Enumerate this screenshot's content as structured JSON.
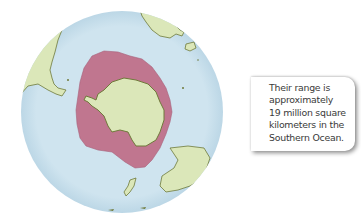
{
  "map": {
    "title": "Southern Ocean polar projection",
    "colors": {
      "ocean": "#cfe4ef",
      "land": "#dbe7b9",
      "land_outline": "#6f7a3b",
      "range": "#c0768f",
      "background": "#ffffff"
    },
    "features": [
      {
        "name": "Antarctica",
        "type": "land"
      },
      {
        "name": "range-area",
        "type": "range",
        "label": "Range around Antarctica"
      },
      {
        "name": "South America",
        "type": "land"
      },
      {
        "name": "Africa",
        "type": "land"
      },
      {
        "name": "Australia",
        "type": "land"
      },
      {
        "name": "New Zealand",
        "type": "land"
      }
    ]
  },
  "callout": {
    "text": "Their range is\napproximately\n19 million square\nkilometers  in the\nSouthern Ocean."
  }
}
